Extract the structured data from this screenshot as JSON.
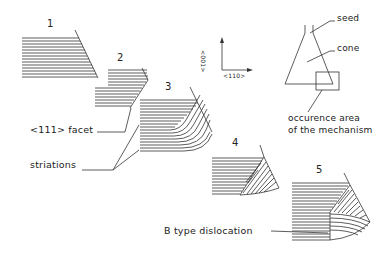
{
  "diagram": {
    "stage_numbers": [
      "1",
      "2",
      "3",
      "4",
      "5"
    ],
    "labels": {
      "facet": "<111> facet",
      "striations": "striations",
      "b_type_dislocation": "B type dislocation",
      "seed": "seed",
      "cone": "cone",
      "occurrence_line1": "occurence area",
      "occurrence_line2": "of the mechanism"
    },
    "axes": {
      "vertical_label": "<001>",
      "horizontal_label": "<110>"
    },
    "colors": {
      "line": "#333333",
      "background": "#ffffff"
    }
  }
}
